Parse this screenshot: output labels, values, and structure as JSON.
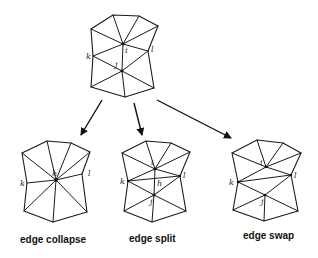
{
  "diagram": {
    "type": "mesh-operations",
    "source_mesh": {
      "vertices": {
        "TL": [
          91,
          29
        ],
        "T": [
          113,
          15
        ],
        "TR": [
          139,
          16
        ],
        "R": [
          158,
          26
        ],
        "l": [
          148,
          51
        ],
        "BR": [
          154,
          88
        ],
        "B": [
          125,
          97
        ],
        "BL": [
          91,
          87
        ],
        "k": [
          93,
          56
        ],
        "i": [
          123,
          44
        ],
        "j": [
          122,
          71
        ]
      },
      "labels": [
        {
          "text": "i",
          "x": 125,
          "y": 53
        },
        {
          "text": "l",
          "x": 151,
          "y": 52
        },
        {
          "text": "k",
          "x": 86,
          "y": 59
        },
        {
          "text": "j",
          "x": 115,
          "y": 67
        }
      ]
    },
    "operations": [
      {
        "caption": "edge collapse",
        "caption_pos": [
          20,
          243
        ],
        "labels": [
          {
            "text": "h",
            "x": 52,
            "y": 176
          },
          {
            "text": "k",
            "x": 20,
            "y": 186
          },
          {
            "text": "l",
            "x": 88,
            "y": 176
          }
        ]
      },
      {
        "caption": "edge split",
        "caption_pos": [
          129,
          242
        ],
        "labels": [
          {
            "text": "i",
            "x": 151,
            "y": 165
          },
          {
            "text": "l",
            "x": 183,
            "y": 178
          },
          {
            "text": "k",
            "x": 120,
            "y": 184
          },
          {
            "text": "h",
            "x": 157,
            "y": 185
          },
          {
            "text": "j",
            "x": 151,
            "y": 204
          }
        ]
      },
      {
        "caption": "edge swap",
        "caption_pos": [
          243,
          239
        ],
        "labels": [
          {
            "text": "i",
            "x": 261,
            "y": 165
          },
          {
            "text": "l",
            "x": 294,
            "y": 178
          },
          {
            "text": "k",
            "x": 229,
            "y": 185
          },
          {
            "text": "j",
            "x": 262,
            "y": 204
          }
        ]
      }
    ],
    "arrows": [
      {
        "from": [
          102,
          100
        ],
        "to": [
          81,
          135
        ],
        "target": "edge collapse"
      },
      {
        "from": [
          134,
          103
        ],
        "to": [
          142,
          135
        ],
        "target": "edge split"
      },
      {
        "from": [
          157,
          100
        ],
        "to": [
          231,
          138
        ],
        "target": "edge swap"
      }
    ]
  }
}
